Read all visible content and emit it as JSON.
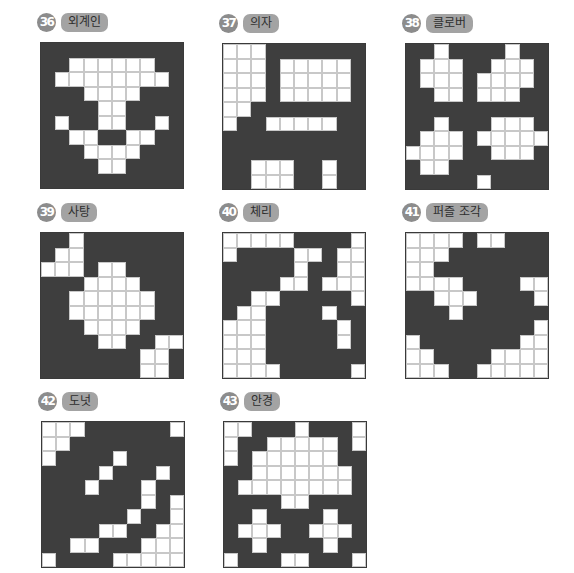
{
  "colors": {
    "filled": "#3e3e3e",
    "empty": "#ffffff",
    "badge": "#8c8c8c",
    "pill": "#a3a3a3"
  },
  "puzzles": [
    {
      "number": "36",
      "title": "외계인",
      "rows": [
        "0000000000",
        "0011111100",
        "0111111110",
        "0001111000",
        "0000110000",
        "0100110010",
        "0011001100",
        "0001111000",
        "0000110000",
        "0000000000"
      ]
    },
    {
      "number": "37",
      "title": "의자",
      "rows": [
        "1110000000",
        "1110111110",
        "1110111110",
        "1110111110",
        "1100000000",
        "1001111100",
        "0000000000",
        "0000000000",
        "0011100100",
        "0011100100"
      ]
    },
    {
      "number": "38",
      "title": "클로버",
      "rows": [
        "0010000100",
        "0111001110",
        "0111011110",
        "0011011100",
        "0000000000",
        "0010001110",
        "0111011111",
        "1111001110",
        "0110000000",
        "0000010000"
      ]
    },
    {
      "number": "39",
      "title": "사탕",
      "rows": [
        "0010000000",
        "0110000000",
        "1110110000",
        "0001111000",
        "0011111100",
        "0011111100",
        "0001111000",
        "0000110011",
        "0000000110",
        "0000000110"
      ]
    },
    {
      "number": "40",
      "title": "체리",
      "rows": [
        "1111100001",
        "1000011011",
        "0000010011",
        "0000110111",
        "0011000001",
        "0110000100",
        "1110000010",
        "1110000010",
        "1110000000",
        "1111000001"
      ]
    },
    {
      "number": "41",
      "title": "퍼즐 조각",
      "rows": [
        "1111011000",
        "1110000000",
        "1100000000",
        "1111000011",
        "0011100001",
        "0001000000",
        "0000000001",
        "1000000011",
        "1100001111",
        "1110011111"
      ]
    },
    {
      "number": "42",
      "title": "도넛",
      "rows": [
        "1110000001",
        "1100000000",
        "1000010000",
        "0000100010",
        "0001000100",
        "0000000101",
        "0000001001",
        "0000110011",
        "0011000111",
        "1000011111"
      ]
    },
    {
      "number": "43",
      "title": "안경",
      "rows": [
        "1100010001",
        "1001111101",
        "1011111100",
        "0011111110",
        "0111111110",
        "0000110000",
        "0010000100",
        "0111001110",
        "0010000100",
        "1000110001"
      ]
    }
  ]
}
